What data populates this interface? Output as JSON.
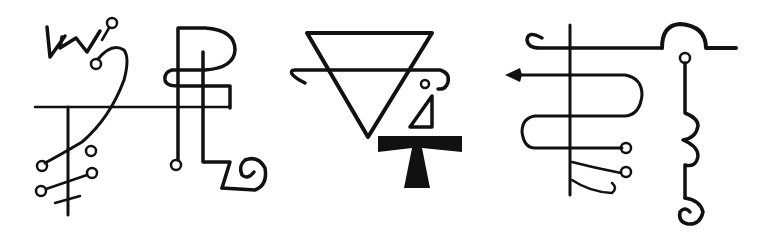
{
  "image": {
    "description": "Three occult sigils drawn in black ink on white background",
    "background": "#ffffff",
    "ink": "#111111"
  },
  "sigils": [
    {
      "name": "sigil-left",
      "elements": [
        "W glyph",
        "horizontal bar",
        "vertical staff with cross",
        "sweeping curve",
        "small circles",
        "P loop",
        "spiral"
      ]
    },
    {
      "name": "sigil-center",
      "elements": [
        "inverted triangle",
        "scroll bar",
        "small circle",
        "wedge",
        "tau cross"
      ]
    },
    {
      "name": "sigil-right",
      "elements": [
        "vertical staff",
        "serpentine line",
        "arrow",
        "circles",
        "arch",
        "3-shaped curves",
        "spiral"
      ]
    }
  ]
}
